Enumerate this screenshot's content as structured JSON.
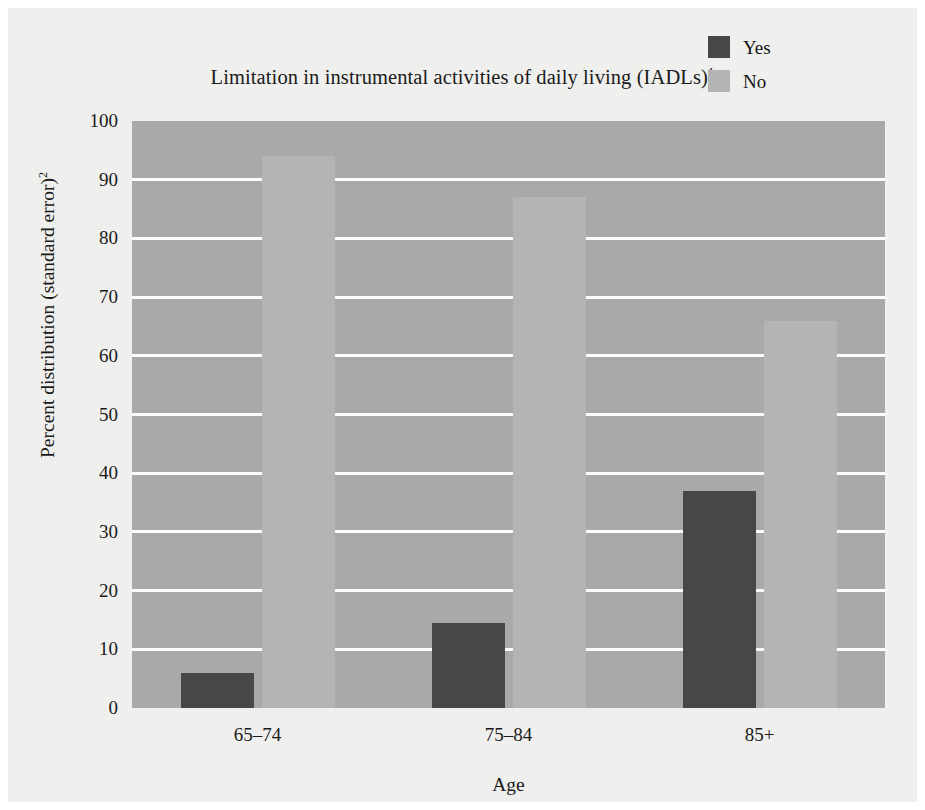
{
  "chart_data": {
    "type": "bar",
    "title": "Limitation in instrumental activities of daily living (IADLs)",
    "title_superscript": "1",
    "xlabel": "Age",
    "ylabel": "Percent distribution (standard error)",
    "ylabel_superscript": "2",
    "categories": [
      "65–74",
      "75–84",
      "85+"
    ],
    "series": [
      {
        "name": "Yes",
        "values": [
          6,
          14.5,
          37
        ],
        "color": "#474747"
      },
      {
        "name": "No",
        "values": [
          94,
          87,
          66
        ],
        "color": "#b4b4b2"
      }
    ],
    "ylim": [
      0,
      100
    ],
    "yticks": [
      0,
      10,
      20,
      30,
      40,
      50,
      60,
      70,
      80,
      90,
      100
    ],
    "ytick_labels": [
      "0",
      "10",
      "20",
      "30",
      "40",
      "50",
      "60",
      "70",
      "80",
      "90",
      "100"
    ],
    "grid": true,
    "grid_color": "#fdfdfb",
    "legend_position": "top-right",
    "plot_background": "#a9a9a7",
    "figure_background": "#efefee"
  },
  "legend": {
    "items": [
      {
        "label": "Yes"
      },
      {
        "label": "No"
      }
    ]
  }
}
